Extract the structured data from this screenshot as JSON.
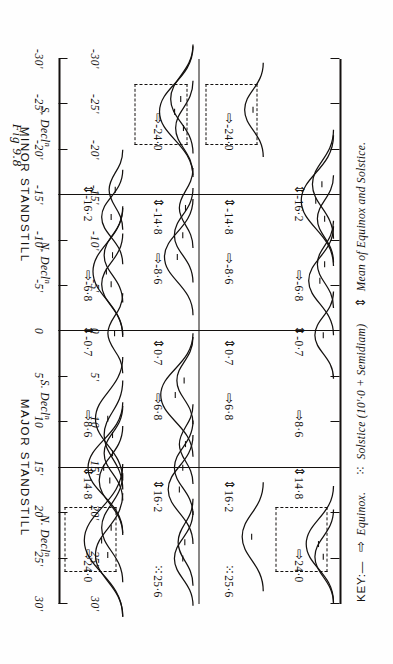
{
  "figure": {
    "caption": "Fig 9.8"
  },
  "axis": {
    "unit_note": "minutes of arc",
    "ticks": [
      "30'",
      "25'",
      "20'",
      "15'",
      "10",
      "5'",
      "0",
      "-5'",
      "-10'",
      "-15'",
      "-20'",
      "-25'",
      "-30'"
    ],
    "values": [
      30,
      25,
      20,
      15,
      10,
      5,
      0,
      -5,
      -10,
      -15,
      -20,
      -25,
      -30
    ],
    "min": -30,
    "max": 30
  },
  "groups": [
    {
      "label": "MAJOR STANDSTILL"
    },
    {
      "label": "MINOR STANDSTILL"
    }
  ],
  "panels": [
    {
      "header": "N. Decl",
      "header_sup": "n",
      "group": "MAJOR STANDSTILL",
      "annotations": [
        {
          "value": "24·0",
          "marker": "equinox",
          "at": 24.0
        },
        {
          "value": "14·8",
          "marker": "mean",
          "at": 14.8
        },
        {
          "value": "8·6",
          "marker": "equinox",
          "at": 8.6
        },
        {
          "value": "-0·7",
          "marker": "mean",
          "at": -0.7
        },
        {
          "value": "-6·8",
          "marker": "equinox",
          "at": -6.8
        },
        {
          "value": "-16·2",
          "marker": "mean",
          "at": -16.2
        }
      ],
      "highlight_box": {
        "from": 19.5,
        "to": 26.5
      },
      "curves": [
        {
          "center": 23.0,
          "height": 62,
          "width": 4.2
        },
        {
          "center": 24.6,
          "height": 44,
          "width": 3.4
        },
        {
          "center": 21.6,
          "height": 34,
          "width": 3.0
        },
        {
          "center": 15.0,
          "height": 56,
          "width": 3.6
        },
        {
          "center": 16.4,
          "height": 38,
          "width": 3.0
        },
        {
          "center": 13.4,
          "height": 30,
          "width": 2.6
        },
        {
          "center": 9.6,
          "height": 44,
          "width": 3.4
        },
        {
          "center": 11.4,
          "height": 30,
          "width": 3.0
        },
        {
          "center": 0.2,
          "height": 24,
          "width": 2.2
        },
        {
          "center": -6.6,
          "height": 48,
          "width": 3.6
        },
        {
          "center": -5.2,
          "height": 34,
          "width": 2.8
        },
        {
          "center": -8.4,
          "height": 30,
          "width": 2.6
        },
        {
          "center": -12.6,
          "height": 34,
          "width": 2.6
        },
        {
          "center": -15.6,
          "height": 22,
          "width": 2.2
        }
      ]
    },
    {
      "header": "S. Decl",
      "header_sup": "n",
      "group": "MAJOR STANDSTILL",
      "annotations": [
        {
          "value": "25·6",
          "marker": "solstice",
          "at": 25.6
        },
        {
          "value": "16·2",
          "marker": "mean",
          "at": 16.2
        },
        {
          "value": "6·8",
          "marker": "equinox",
          "at": 6.8
        },
        {
          "value": "0·7",
          "marker": "mean",
          "at": 0.7
        },
        {
          "value": "-8·6",
          "marker": "equinox",
          "at": -8.6
        },
        {
          "value": "-14·8",
          "marker": "mean",
          "at": -14.8
        },
        {
          "value": "-24·0",
          "marker": "equinox",
          "at": -24.0
        }
      ],
      "highlight_box": {
        "from": -27.0,
        "to": -20.5
      },
      "curves": [
        {
          "center": 25.0,
          "height": 30,
          "width": 2.6
        },
        {
          "center": 23.2,
          "height": 24,
          "width": 2.4
        },
        {
          "center": 17.4,
          "height": 40,
          "width": 3.0
        },
        {
          "center": 15.0,
          "height": 30,
          "width": 2.6
        },
        {
          "center": 12.4,
          "height": 22,
          "width": 2.2
        },
        {
          "center": 7.0,
          "height": 52,
          "width": 3.4
        },
        {
          "center": 5.4,
          "height": 26,
          "width": 2.4
        },
        {
          "center": -8.2,
          "height": 46,
          "width": 3.2
        },
        {
          "center": -10.6,
          "height": 30,
          "width": 2.6
        },
        {
          "center": -13.6,
          "height": 22,
          "width": 2.2
        },
        {
          "center": -24.2,
          "height": 54,
          "width": 3.6
        },
        {
          "center": -25.6,
          "height": 36,
          "width": 3.0
        },
        {
          "center": -22.4,
          "height": 28,
          "width": 2.6
        }
      ]
    },
    {
      "header": "N. Decl",
      "header_sup": "n",
      "group": "MINOR STANDSTILL",
      "annotations": [
        {
          "value": "25·6",
          "marker": "solstice",
          "at": 25.6
        },
        {
          "value": "16·2",
          "marker": "mean",
          "at": 16.2
        },
        {
          "value": "6·8",
          "marker": "equinox",
          "at": 6.8
        },
        {
          "value": "0·7",
          "marker": "mean",
          "at": 0.7
        },
        {
          "value": "-8·6",
          "marker": "equinox",
          "at": -8.6
        },
        {
          "value": "-14·8",
          "marker": "mean",
          "at": -14.8
        },
        {
          "value": "-24·0",
          "marker": "equinox",
          "at": -24.0
        }
      ],
      "highlight_box": {
        "from": -27.0,
        "to": -20.5
      },
      "curves": [
        {
          "center": 22.6,
          "height": 34,
          "width": 3.0
        },
        {
          "center": -24.4,
          "height": 30,
          "width": 2.6
        }
      ]
    },
    {
      "header": "S. Decl",
      "header_sup": "n",
      "group": "MINOR STANDSTILL",
      "annotations": [
        {
          "value": "24·0",
          "marker": "equinox",
          "at": 24.0
        },
        {
          "value": "14·8",
          "marker": "mean",
          "at": 14.8
        },
        {
          "value": "8·6",
          "marker": "equinox",
          "at": 8.6
        },
        {
          "value": "-0·7",
          "marker": "mean",
          "at": -0.7
        },
        {
          "value": "-6·8",
          "marker": "equinox",
          "at": -6.8
        },
        {
          "value": "-16·2",
          "marker": "mean",
          "at": -16.2
        }
      ],
      "highlight_box": {
        "from": 19.5,
        "to": 26.5
      },
      "curves": [
        {
          "center": 23.4,
          "height": 44,
          "width": 3.2
        },
        {
          "center": 24.8,
          "height": 30,
          "width": 2.6
        },
        {
          "center": 0.4,
          "height": 30,
          "width": 2.4
        },
        {
          "center": -5.6,
          "height": 40,
          "width": 3.0
        },
        {
          "center": -7.4,
          "height": 26,
          "width": 2.4
        },
        {
          "center": -14.4,
          "height": 52,
          "width": 3.6
        },
        {
          "center": -16.2,
          "height": 34,
          "width": 3.0
        },
        {
          "center": -12.4,
          "height": 26,
          "width": 2.4
        }
      ]
    }
  ],
  "key": {
    "title": "KEY:—",
    "items": [
      {
        "marker": "equinox",
        "glyph": "⇨",
        "label": "Equinox."
      },
      {
        "marker": "solstice",
        "glyph": "⁙",
        "label": "Solstice (10'·0 + Semidiam)"
      },
      {
        "marker": "mean",
        "glyph": "⇕",
        "label": "Mean of Equinox and Solstice."
      }
    ]
  },
  "chart_data": {
    "type": "line",
    "title": "Fig 9.8",
    "xlabel": "Declination offset (minutes of arc)",
    "ylabel": "Frequency",
    "xlim": [
      -30,
      30
    ],
    "grid": false,
    "legend": "bottom",
    "tick_labels": [
      "30'",
      "25'",
      "20'",
      "15'",
      "10",
      "5'",
      "0",
      "-5'",
      "-10'",
      "-15'",
      "-20'",
      "-25'",
      "-30'"
    ],
    "panels": [
      {
        "name": "N. Declⁿ MAJOR STANDSTILL",
        "marked_values": [
          24.0,
          14.8,
          8.6,
          -0.7,
          -6.8,
          -16.2
        ],
        "marker_types": [
          "equinox",
          "mean",
          "equinox",
          "mean",
          "equinox",
          "mean"
        ]
      },
      {
        "name": "S. Declⁿ MAJOR STANDSTILL",
        "marked_values": [
          25.6,
          16.2,
          6.8,
          0.7,
          -8.6,
          -14.8,
          -24.0
        ],
        "marker_types": [
          "solstice",
          "mean",
          "equinox",
          "mean",
          "equinox",
          "mean",
          "equinox"
        ]
      },
      {
        "name": "N. Declⁿ MINOR STANDSTILL",
        "marked_values": [
          25.6,
          16.2,
          6.8,
          0.7,
          -8.6,
          -14.8,
          -24.0
        ],
        "marker_types": [
          "solstice",
          "mean",
          "equinox",
          "mean",
          "equinox",
          "mean",
          "equinox"
        ]
      },
      {
        "name": "S. Declⁿ MINOR STANDSTILL",
        "marked_values": [
          24.0,
          14.8,
          8.6,
          -0.7,
          -6.8,
          -16.2
        ],
        "marker_types": [
          "equinox",
          "mean",
          "equinox",
          "mean",
          "equinox",
          "mean"
        ]
      }
    ]
  }
}
